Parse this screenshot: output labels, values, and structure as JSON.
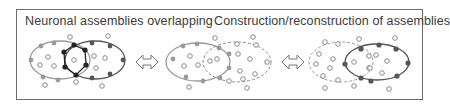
{
  "titles": {
    "left": "Neuronal assemblies overlapping",
    "right": "Construction/reconstruction of assemblies"
  },
  "colors": {
    "frame": "#6e6e6e",
    "assembly_a": "#9a9a9a",
    "assembly_b": "#555555",
    "overlap": "#222222",
    "inactive_neuron": "#8a8a8a"
  },
  "arrows": [
    {
      "name": "bidirectional-arrow-1",
      "symbol": "double-left-right-arrow"
    },
    {
      "name": "bidirectional-arrow-2",
      "symbol": "double-left-right-arrow"
    }
  ],
  "panels": [
    {
      "name": "overlapping-assemblies",
      "description": "Two solid-outline ellipses overlapping with a shared subset of dark neurons"
    },
    {
      "name": "construction-state",
      "description": "Left solid ellipse active, right dashed ellipse forming"
    },
    {
      "name": "reconstruction-state",
      "description": "Left dashed ellipse dissolving, right solid ellipse active"
    }
  ]
}
